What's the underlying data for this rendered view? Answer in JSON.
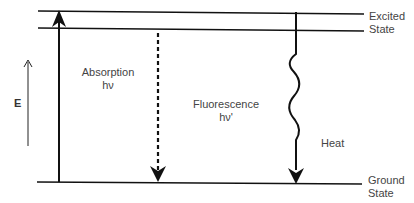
{
  "diagram": {
    "type": "energy-level (Jablonski) diagram",
    "levels": {
      "excited_label_line1": "Excited",
      "excited_label_line2": "State",
      "ground_label_line1": "Ground",
      "ground_label_line2": "State"
    },
    "axis": {
      "label": "E"
    },
    "transitions": {
      "absorption_line1": "Absorption",
      "absorption_line2": "hν",
      "fluorescence_line1": "Fluorescence",
      "fluorescence_line2": "hν'",
      "heat": "Heat"
    },
    "colors": {
      "line": "#111111",
      "text": "#444444",
      "background": "#ffffff"
    }
  }
}
